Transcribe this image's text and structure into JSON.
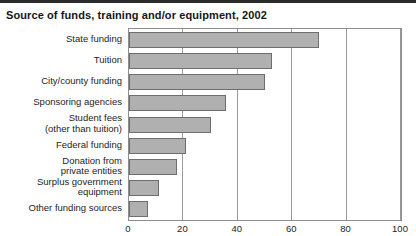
{
  "figure": {
    "title": "Source of funds, training and/or equipment, 2002",
    "top_rule_color": "#2b2b2b",
    "background_color": "#ffffff"
  },
  "chart_data": {
    "type": "bar",
    "orientation": "horizontal",
    "title": "Source of funds, training and/or equipment, 2002",
    "xlabel": "",
    "ylabel": "",
    "xlim": [
      0,
      100
    ],
    "ylim": null,
    "grid": true,
    "grid_axis": "x",
    "legend": false,
    "bar_fill_color": "#b0b0b0",
    "bar_edge_color": "#6e6e6e",
    "xticks": [
      0,
      20,
      40,
      60,
      80,
      100
    ],
    "xticklabels": [
      "0",
      "20",
      "40",
      "60",
      "80",
      "100"
    ],
    "categories": [
      "State funding",
      "Tuition",
      "City/county funding",
      "Sponsoring agencies",
      "Student fees\n(other than tuition)",
      "Federal funding",
      "Donation from\nprivate entities",
      "Surplus government\nequipment",
      "Other funding sources"
    ],
    "values": [
      70,
      52.5,
      50,
      35.5,
      30,
      21,
      17.5,
      11,
      7
    ]
  }
}
